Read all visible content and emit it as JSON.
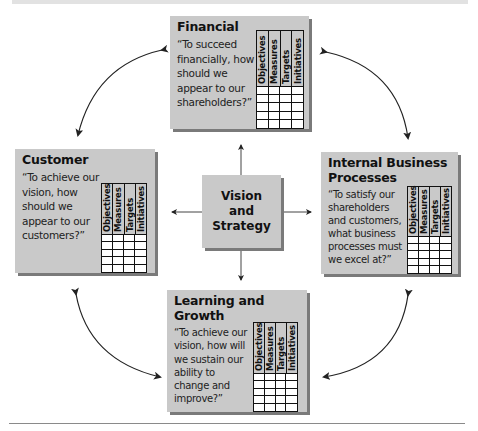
{
  "diagram": {
    "center": {
      "line1": "Vision",
      "line2": "and",
      "line3": "Strategy"
    },
    "grid_columns": [
      "Objectives",
      "Measures",
      "Targets",
      "Initiatives"
    ],
    "grid_rows": 5,
    "perspectives": {
      "financial": {
        "title": "Financial",
        "quote": [
          "“To succeed",
          "financially, how",
          "should we",
          "appear to our",
          "shareholders?”"
        ]
      },
      "customer": {
        "title": "Customer",
        "quote": [
          "“To achieve our",
          "vision, how",
          "should we",
          "appear to our",
          "customers?”"
        ]
      },
      "internal": {
        "title_line1": "Internal Business",
        "title_line2": "Processes",
        "quote": [
          "“To satisfy our",
          "shareholders",
          "and customers,",
          "what business",
          "processes must",
          "we excel at?”"
        ]
      },
      "learning": {
        "title_line1": "Learning and",
        "title_line2": "Growth",
        "quote": [
          "“To achieve our",
          "vision, how will",
          "we sustain our",
          "ability to",
          "change and",
          "improve?”"
        ]
      }
    },
    "colors": {
      "box_fill": "#c9c9c9",
      "box_shadow": "#7a7a7a",
      "grid_line": "#111111",
      "arrow": "#222222"
    }
  }
}
